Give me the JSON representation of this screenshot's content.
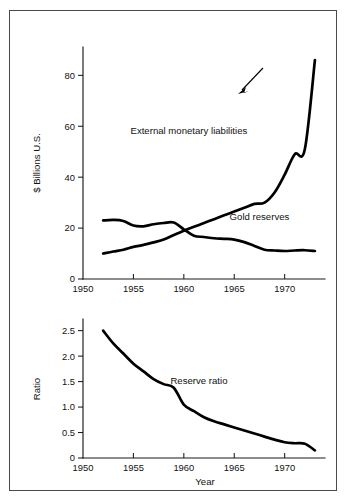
{
  "figure": {
    "background_color": "#ffffff",
    "border_color": "#4a4a4a",
    "line_color": "#000000"
  },
  "chart_data": [
    {
      "type": "line",
      "panel": "top",
      "title": "",
      "xlabel": "",
      "ylabel": "$ Billions U.S.",
      "xlim": [
        1950,
        1974
      ],
      "ylim": [
        0,
        88
      ],
      "xticks": [
        1950,
        1955,
        1960,
        1965,
        1970
      ],
      "xtick_labels": [
        "1950",
        "1955",
        "1960",
        "1965",
        "1970"
      ],
      "yticks": [
        0,
        20,
        40,
        60,
        80
      ],
      "ytick_labels": [
        "0",
        "20",
        "40",
        "60",
        "80"
      ],
      "grid": false,
      "legend": "inline-annotations",
      "series": [
        {
          "name": "External monetary liabilities",
          "label_position": "inside-upper-left",
          "x": [
            1952,
            1953,
            1954,
            1955,
            1956,
            1957,
            1958,
            1959,
            1960,
            1961,
            1962,
            1963,
            1964,
            1965,
            1966,
            1967,
            1968,
            1969,
            1970,
            1971,
            1972,
            1973
          ],
          "values": [
            10.0,
            10.8,
            11.5,
            12.6,
            13.4,
            14.4,
            15.5,
            17.3,
            19.0,
            20.5,
            22.0,
            23.5,
            25.0,
            26.5,
            28.0,
            29.5,
            30.0,
            34.0,
            41.0,
            49.0,
            51.0,
            86.0
          ]
        },
        {
          "name": "Gold reserves",
          "label_position": "right-with-arrow",
          "x": [
            1952,
            1953,
            1954,
            1955,
            1956,
            1957,
            1958,
            1959,
            1960,
            1961,
            1962,
            1963,
            1964,
            1965,
            1966,
            1967,
            1968,
            1969,
            1970,
            1971,
            1972,
            1973
          ],
          "values": [
            23.0,
            23.2,
            22.8,
            21.0,
            20.7,
            21.5,
            22.0,
            22.2,
            19.5,
            17.0,
            16.5,
            16.0,
            15.8,
            15.5,
            14.5,
            13.0,
            11.5,
            11.2,
            11.0,
            11.2,
            11.3,
            11.0
          ]
        }
      ],
      "annotations": [
        {
          "text": "External monetary liabilities",
          "x": 1960.5,
          "y": 57
        },
        {
          "text": "Gold reserves",
          "x": 1967.5,
          "y": 23
        }
      ]
    },
    {
      "type": "line",
      "panel": "bottom",
      "title": "",
      "xlabel": "Year",
      "ylabel": "Ratio",
      "xlim": [
        1950,
        1974
      ],
      "ylim": [
        0,
        2.65
      ],
      "xticks": [
        1950,
        1955,
        1960,
        1965,
        1970
      ],
      "xtick_labels": [
        "1950",
        "1955",
        "1960",
        "1965",
        "1970"
      ],
      "yticks": [
        0,
        0.5,
        1.0,
        1.5,
        2.0,
        2.5
      ],
      "ytick_labels": [
        "0",
        "0.5",
        "1.0",
        "1.5",
        "2.0",
        "2.5"
      ],
      "grid": false,
      "legend": "inline-annotations",
      "series": [
        {
          "name": "Reserve ratio",
          "label_position": "inside-center",
          "x": [
            1952,
            1953,
            1954,
            1955,
            1956,
            1957,
            1958,
            1959,
            1960,
            1961,
            1962,
            1963,
            1964,
            1965,
            1966,
            1967,
            1968,
            1969,
            1970,
            1971,
            1972,
            1973
          ],
          "values": [
            2.5,
            2.25,
            2.05,
            1.85,
            1.7,
            1.55,
            1.45,
            1.38,
            1.05,
            0.92,
            0.8,
            0.72,
            0.66,
            0.6,
            0.54,
            0.48,
            0.42,
            0.36,
            0.31,
            0.29,
            0.28,
            0.15
          ]
        }
      ],
      "annotations": [
        {
          "text": "Reserve ratio",
          "x": 1961.5,
          "y": 1.45
        }
      ]
    }
  ]
}
